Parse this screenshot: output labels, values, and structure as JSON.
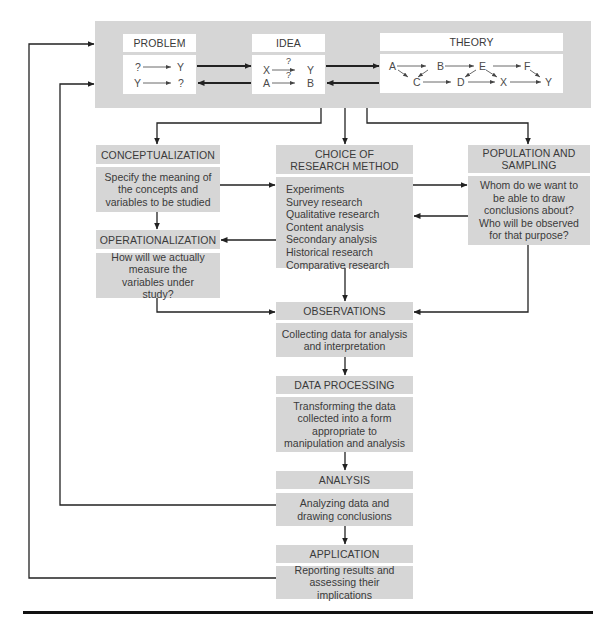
{
  "top_panel": {
    "problem": {
      "title": "PROBLEM",
      "row1": [
        "?",
        "Y"
      ],
      "row2": [
        "Y",
        "?"
      ]
    },
    "idea": {
      "title": "IDEA",
      "row1": [
        "X",
        "?",
        "Y"
      ],
      "row2": [
        "A",
        "?",
        "B"
      ]
    },
    "theory": {
      "title": "THEORY",
      "nodes": [
        "A",
        "B",
        "E",
        "F",
        "C",
        "D",
        "X",
        "Y"
      ]
    }
  },
  "conceptualization": {
    "title": "CONCEPTUALIZATION",
    "body": "Specify the meaning of the concepts and variables to be studied"
  },
  "operationalization": {
    "title": "OPERATIONALIZATION",
    "body": "How will we actually measure the variables under study?"
  },
  "choice": {
    "title_line1": "CHOICE OF",
    "title_line2": "RESEARCH METHOD",
    "methods": [
      "Experiments",
      "Survey research",
      "Qualitative research",
      "Content analysis",
      "Secondary analysis",
      "Historical research",
      "Comparative research"
    ]
  },
  "population": {
    "title_line1": "POPULATION AND",
    "title_line2": "SAMPLING",
    "body": "Whom do we want to be able to draw conclusions about? Who will be observed for that purpose?"
  },
  "observations": {
    "title": "OBSERVATIONS",
    "body": "Collecting data for analysis and interpretation"
  },
  "data_processing": {
    "title": "DATA PROCESSING",
    "body": "Transforming the data collected into a form appropriate to manipulation and analysis"
  },
  "analysis": {
    "title": "ANALYSIS",
    "body": "Analyzing data and drawing conclusions"
  },
  "application": {
    "title": "APPLICATION",
    "body": "Reporting results and assessing their implications"
  },
  "colors": {
    "box_fill": "#d6d6d6",
    "line": "#222222",
    "text": "#3a3a3a"
  }
}
